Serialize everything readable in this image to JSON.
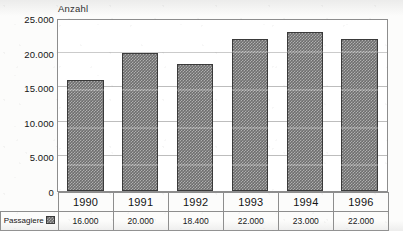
{
  "chart_data": {
    "type": "bar",
    "title": "",
    "ylabel": "Anzahl",
    "xlabel": "",
    "categories": [
      "1990",
      "1991",
      "1992",
      "1993",
      "1994",
      "1996"
    ],
    "values": [
      16000,
      20000,
      18400,
      22000,
      23000,
      22000
    ],
    "value_labels": [
      "16.000",
      "20.000",
      "18.400",
      "22.000",
      "23.000",
      "22.000"
    ],
    "series": [
      {
        "name": "Passagiere",
        "values": [
          16000,
          20000,
          18400,
          22000,
          23000,
          22000
        ]
      }
    ],
    "ylim": [
      0,
      25000
    ],
    "ytick_values": [
      0,
      5000,
      10000,
      15000,
      20000,
      25000
    ],
    "ytick_labels": [
      "0",
      "5.000",
      "10.000",
      "15.000",
      "20.000",
      "25.000"
    ],
    "grid": true,
    "grid_axis": "y",
    "legend": "bottom-left",
    "legend_entries": [
      "Passagiere"
    ],
    "bar_color": "#6e6e6e",
    "bar_edge_color": "#3a3a3a",
    "grid_color": "#bdbdbd",
    "frame_color": "#8d8d8d",
    "background": "#ffffff"
  },
  "axis": {
    "y_title": "Anzahl"
  },
  "legend": {
    "label": "Passagiere",
    "swatch_name": "passagiere-swatch"
  },
  "table": {
    "year_row": [
      "1990",
      "1991",
      "1992",
      "1993",
      "1994",
      "1996"
    ],
    "value_row": [
      "16.000",
      "20.000",
      "18.400",
      "22.000",
      "23.000",
      "22.000"
    ]
  }
}
